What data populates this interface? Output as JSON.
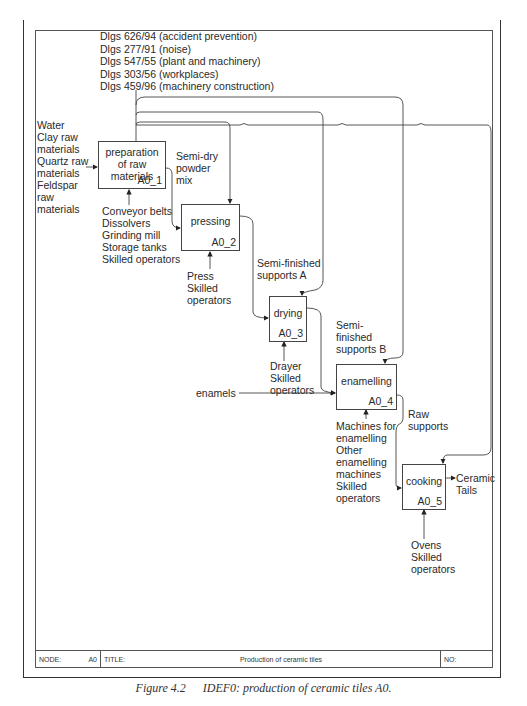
{
  "controls": [
    "Dlgs 626/94 (accident prevention)",
    "Dlgs 277/91 (noise)",
    "Dlgs 547/55 (plant and machinery)",
    "Dlgs 303/56 (workplaces)",
    "Dlgs 459/96 (machinery construction)"
  ],
  "inputs": {
    "raw_materials": "Water\nClay raw\nmaterials\nQuartz raw\nmaterials\nFeldspar\nraw\nmaterials",
    "enamels": "enamels"
  },
  "activities": [
    {
      "name": "preparation\nof raw\nmaterials",
      "code": "A0_1",
      "mechanism": "Conveyor belts\nDissolvers\nGrinding mill\nStorage tanks\nSkilled operators"
    },
    {
      "name": "pressing",
      "code": "A0_2",
      "mechanism": "Press\nSkilled\noperators"
    },
    {
      "name": "drying",
      "code": "A0_3",
      "mechanism": "Drayer\nSkilled\noperators"
    },
    {
      "name": "enamelling",
      "code": "A0_4",
      "mechanism": "Machines for\nenamelling\nOther\nenamelling\nmachines\nSkilled\noperators"
    },
    {
      "name": "cooking",
      "code": "A0_5",
      "mechanism": "Ovens\nSkilled\noperators"
    }
  ],
  "flows": {
    "semi_dry": "Semi-dry\npowder\nmix",
    "semi_a": "Semi-finished\nsupports A",
    "semi_b": "Semi-\nfinished\nsupports B",
    "raw_supports": "Raw\nsupports",
    "output": "Ceramic\nTails"
  },
  "footer": {
    "node_label": "NODE:",
    "node_value": "A0",
    "title_label": "TITLE:",
    "title_value": "Production of ceramic tiles",
    "no_label": "NO:"
  },
  "caption": {
    "number": "Figure 4.2",
    "text": "IDEF0: production of ceramic tiles A0."
  }
}
